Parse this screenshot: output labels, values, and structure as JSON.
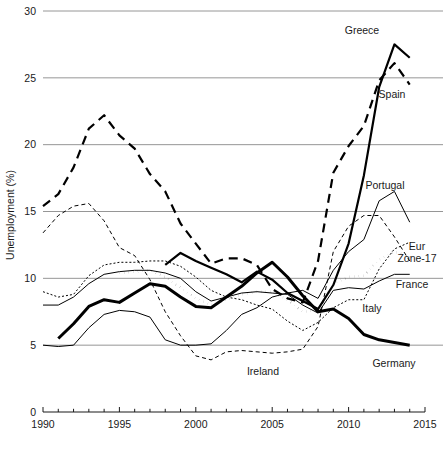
{
  "chart_data": {
    "type": "line",
    "title": "",
    "xlabel": "",
    "ylabel": "Unemployment (%)",
    "xlim": [
      1990,
      2015
    ],
    "ylim": [
      0,
      30
    ],
    "grid": true,
    "legend_position": "inline-right-labels",
    "y_ticks": [
      "0",
      "5",
      "10",
      "15",
      "20",
      "25",
      "30"
    ],
    "y_tick_values": [
      0,
      5,
      10,
      15,
      20,
      25,
      30
    ],
    "x_ticks": [
      "1990",
      "1995",
      "2000",
      "2005",
      "2010",
      "2015"
    ],
    "x_tick_values": [
      1990,
      1995,
      2000,
      2005,
      2010,
      2015
    ],
    "x_minor_tick_step": 1,
    "series": [
      {
        "name": "Greece",
        "label": "Greece",
        "style": "solid",
        "width": 2.2,
        "color": "#000000",
        "x": [
          1998,
          1999,
          2000,
          2001,
          2002,
          2003,
          2004,
          2005,
          2006,
          2007,
          2008,
          2009,
          2010,
          2011,
          2012,
          2013,
          2014
        ],
        "values": [
          11.0,
          11.9,
          11.3,
          10.8,
          10.3,
          9.7,
          10.5,
          9.9,
          8.9,
          8.3,
          7.7,
          9.5,
          12.6,
          17.7,
          24.3,
          27.5,
          26.5
        ]
      },
      {
        "name": "Spain",
        "label": "Spain",
        "style": "dashed",
        "width": 2.2,
        "color": "#000000",
        "x": [
          1990,
          1991,
          1992,
          1993,
          1994,
          1995,
          1996,
          1997,
          1998,
          1999,
          2000,
          2001,
          2002,
          2003,
          2004,
          2005,
          2006,
          2007,
          2008,
          2009,
          2010,
          2011,
          2012,
          2013,
          2014
        ],
        "values": [
          15.4,
          16.3,
          18.3,
          21.2,
          22.2,
          20.7,
          19.7,
          17.8,
          16.5,
          14.1,
          12.6,
          11.1,
          11.5,
          11.5,
          11.0,
          9.2,
          8.5,
          8.2,
          11.3,
          17.9,
          19.9,
          21.4,
          24.8,
          26.1,
          24.5
        ]
      },
      {
        "name": "Portugal",
        "label": "Portugal",
        "style": "solid",
        "width": 1.0,
        "color": "#000000",
        "x": [
          1990,
          1991,
          1992,
          1993,
          1994,
          1995,
          1996,
          1997,
          1998,
          1999,
          2000,
          2001,
          2002,
          2003,
          2004,
          2005,
          2006,
          2007,
          2008,
          2009,
          2010,
          2011,
          2012,
          2013,
          2014
        ],
        "values": [
          5.0,
          4.9,
          5.0,
          6.3,
          7.3,
          7.6,
          7.5,
          7.1,
          5.4,
          5.0,
          5.0,
          5.1,
          6.1,
          7.3,
          7.8,
          8.6,
          8.9,
          9.1,
          8.5,
          10.6,
          12.0,
          12.9,
          15.8,
          16.5,
          14.2
        ]
      },
      {
        "name": "Eur Zone-17",
        "label": "Eur\nZone-17",
        "style": "dotted-thick",
        "width": 2.6,
        "color": "#000000",
        "x": [
          1995,
          1996,
          1997,
          1998,
          1999,
          2000,
          2001,
          2002,
          2003,
          2004,
          2005,
          2006,
          2007,
          2008,
          2009,
          2010,
          2011,
          2012,
          2013,
          2014
        ],
        "values": [
          10.4,
          10.5,
          10.6,
          10.1,
          9.3,
          8.5,
          8.0,
          8.4,
          8.8,
          9.0,
          9.0,
          8.4,
          7.5,
          7.6,
          9.6,
          10.1,
          10.2,
          11.4,
          12.0,
          11.6
        ]
      },
      {
        "name": "France",
        "label": "France",
        "style": "solid",
        "width": 1.0,
        "color": "#000000",
        "x": [
          1990,
          1991,
          1992,
          1993,
          1994,
          1995,
          1996,
          1997,
          1998,
          1999,
          2000,
          2001,
          2002,
          2003,
          2004,
          2005,
          2006,
          2007,
          2008,
          2009,
          2010,
          2011,
          2012,
          2013,
          2014
        ],
        "values": [
          8.0,
          8.0,
          8.6,
          9.6,
          10.3,
          10.5,
          10.6,
          10.6,
          10.4,
          10.0,
          9.0,
          8.3,
          8.6,
          8.9,
          9.0,
          8.9,
          8.8,
          8.0,
          7.4,
          9.1,
          9.3,
          9.2,
          9.8,
          10.3,
          10.3
        ]
      },
      {
        "name": "Italy",
        "label": "Italy",
        "style": "dotted-fine",
        "width": 1.0,
        "color": "#000000",
        "x": [
          1990,
          1991,
          1992,
          1993,
          1994,
          1995,
          1996,
          1997,
          1998,
          1999,
          2000,
          2001,
          2002,
          2003,
          2004,
          2005,
          2006,
          2007,
          2008,
          2009,
          2010,
          2011,
          2012,
          2013,
          2014
        ],
        "values": [
          9.0,
          8.6,
          8.8,
          10.2,
          11.0,
          11.2,
          11.2,
          11.3,
          11.3,
          10.9,
          10.1,
          9.1,
          8.6,
          8.4,
          8.0,
          7.7,
          6.8,
          6.1,
          6.7,
          7.8,
          8.4,
          8.4,
          10.7,
          12.2,
          12.7
        ]
      },
      {
        "name": "Ireland",
        "label": "Ireland",
        "style": "dashed-fine",
        "width": 1.0,
        "color": "#000000",
        "x": [
          1990,
          1991,
          1992,
          1993,
          1994,
          1995,
          1996,
          1997,
          1998,
          1999,
          2000,
          2001,
          2002,
          2003,
          2004,
          2005,
          2006,
          2007,
          2008,
          2009,
          2010,
          2011,
          2012,
          2013,
          2014
        ],
        "values": [
          13.4,
          14.7,
          15.4,
          15.6,
          14.3,
          12.3,
          11.7,
          9.9,
          7.5,
          5.7,
          4.2,
          3.9,
          4.5,
          4.6,
          4.5,
          4.4,
          4.5,
          4.7,
          6.4,
          12.0,
          13.9,
          14.7,
          14.7,
          13.1,
          11.3
        ]
      },
      {
        "name": "Germany",
        "label": "Germany",
        "style": "solid",
        "width": 3.0,
        "color": "#000000",
        "x": [
          1991,
          1992,
          1993,
          1994,
          1995,
          1996,
          1997,
          1998,
          1999,
          2000,
          2001,
          2002,
          2003,
          2004,
          2005,
          2006,
          2007,
          2008,
          2009,
          2010,
          2011,
          2012,
          2013,
          2014
        ],
        "values": [
          5.5,
          6.6,
          7.9,
          8.4,
          8.2,
          8.9,
          9.6,
          9.4,
          8.6,
          7.9,
          7.8,
          8.6,
          9.4,
          10.4,
          11.2,
          10.1,
          8.7,
          7.5,
          7.7,
          7.0,
          5.8,
          5.4,
          5.2,
          5.0
        ]
      }
    ],
    "annotations": [
      {
        "name": "greece-label",
        "text": "Greece",
        "x_px": 362,
        "y_px": 34
      },
      {
        "name": "spain-label",
        "text": "Spain",
        "x_px": 392,
        "y_px": 98
      },
      {
        "name": "portugal-label",
        "text": "Portugal",
        "x_px": 385,
        "y_px": 189
      },
      {
        "name": "eurzone-label1",
        "text": "Eur",
        "x_px": 417,
        "y_px": 250
      },
      {
        "name": "eurzone-label2",
        "text": "Zone-17",
        "x_px": 417,
        "y_px": 262
      },
      {
        "name": "france-label",
        "text": "France",
        "x_px": 412,
        "y_px": 288
      },
      {
        "name": "italy-label",
        "text": "Italy",
        "x_px": 372,
        "y_px": 312
      },
      {
        "name": "ireland-label",
        "text": "Ireland",
        "x_px": 263,
        "y_px": 375
      },
      {
        "name": "germany-label",
        "text": "Germany",
        "x_px": 394,
        "y_px": 367
      }
    ]
  }
}
